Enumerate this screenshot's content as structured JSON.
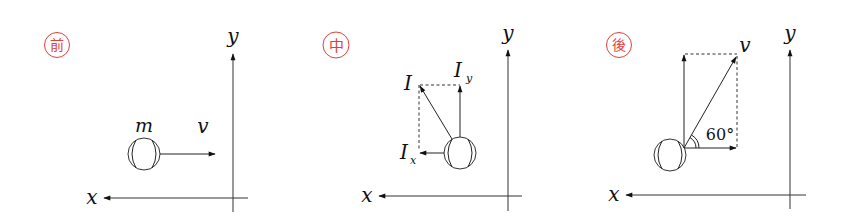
{
  "diagram": {
    "panels": [
      {
        "stage_label": "前",
        "stage_meaning": "before",
        "axes": {
          "x_label": "x",
          "y_label": "y"
        },
        "ball_mass_label": "m",
        "velocity_label": "v"
      },
      {
        "stage_label": "中",
        "stage_meaning": "during",
        "axes": {
          "x_label": "x",
          "y_label": "y"
        },
        "impulse_label": "I",
        "impulse_x_label": "I",
        "impulse_x_sub": "x",
        "impulse_y_label": "I",
        "impulse_y_sub": "y"
      },
      {
        "stage_label": "後",
        "stage_meaning": "after",
        "axes": {
          "x_label": "x",
          "y_label": "y"
        },
        "velocity_label": "v",
        "angle_label": "60°"
      }
    ],
    "colors": {
      "stamp": "#e0403a",
      "ink": "#222222"
    }
  }
}
